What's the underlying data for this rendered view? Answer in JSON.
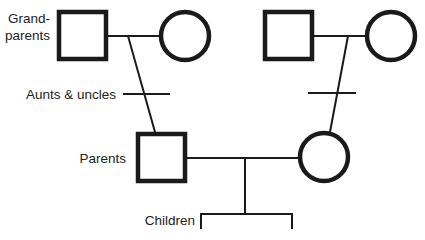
{
  "diagram": {
    "type": "pedigree-chart",
    "colors": {
      "stroke": "#1a1a1a",
      "text": "#222222",
      "background": "#ffffff"
    },
    "labels": {
      "grandparents_line1": "Grand-",
      "grandparents_line2": "parents",
      "aunts_uncles": "Aunts & uncles",
      "parents": "Parents",
      "children": "Children"
    },
    "nodes": [
      {
        "id": "paternal-grandfather",
        "shape": "square",
        "generation": "grandparents"
      },
      {
        "id": "paternal-grandmother",
        "shape": "circle",
        "generation": "grandparents"
      },
      {
        "id": "maternal-grandfather",
        "shape": "square",
        "generation": "grandparents"
      },
      {
        "id": "maternal-grandmother",
        "shape": "circle",
        "generation": "grandparents"
      },
      {
        "id": "father",
        "shape": "square",
        "generation": "parents"
      },
      {
        "id": "mother",
        "shape": "circle",
        "generation": "parents"
      }
    ],
    "edges": [
      {
        "from": "paternal-grandfather",
        "to": "paternal-grandmother",
        "type": "mating"
      },
      {
        "from": "maternal-grandfather",
        "to": "maternal-grandmother",
        "type": "mating"
      },
      {
        "from": "paternal-grandparents",
        "to": "father",
        "type": "descent",
        "sibship_tick": true
      },
      {
        "from": "maternal-grandparents",
        "to": "mother",
        "type": "descent",
        "sibship_tick": true
      },
      {
        "from": "father",
        "to": "mother",
        "type": "mating"
      },
      {
        "from": "parents",
        "to": "children",
        "type": "sibship-bracket"
      }
    ]
  }
}
